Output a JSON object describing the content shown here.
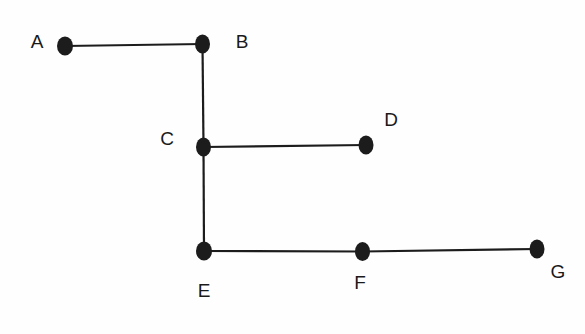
{
  "figure": {
    "type": "node-link-diagram",
    "title": "",
    "background_color": "#fefefe",
    "ink_color": "#1c1c1c",
    "label_color": "#1a1a1a"
  },
  "nodes": [
    {
      "id": "A",
      "label": "A",
      "cx": 65,
      "cy": 46,
      "rx": 8,
      "ry": 9.5,
      "label_x": 37,
      "label_y": 43
    },
    {
      "id": "B",
      "label": "B",
      "cx": 202.5,
      "cy": 44,
      "rx": 7.5,
      "ry": 9.5,
      "label_x": 242,
      "label_y": 43
    },
    {
      "id": "C",
      "label": "C",
      "cx": 203.5,
      "cy": 147,
      "rx": 7.5,
      "ry": 9.5,
      "label_x": 167,
      "label_y": 140
    },
    {
      "id": "D",
      "label": "D",
      "cx": 366,
      "cy": 145,
      "rx": 7.5,
      "ry": 9.5,
      "label_x": 391,
      "label_y": 121
    },
    {
      "id": "E",
      "label": "E",
      "cx": 204,
      "cy": 251,
      "rx": 8,
      "ry": 9.5,
      "label_x": 204,
      "label_y": 292
    },
    {
      "id": "F",
      "label": "F",
      "cx": 362.5,
      "cy": 251.5,
      "rx": 7.5,
      "ry": 9.5,
      "label_x": 360,
      "label_y": 284
    },
    {
      "id": "G",
      "label": "G",
      "cx": 537,
      "cy": 249,
      "rx": 7.5,
      "ry": 9.5,
      "label_x": 558,
      "label_y": 273
    }
  ],
  "edges": [
    {
      "id": "edge-a-b",
      "from": "A",
      "to": "B",
      "x1": 65,
      "y1": 46,
      "x2": 202.5,
      "y2": 44
    },
    {
      "id": "edge-b-c",
      "from": "B",
      "to": "C",
      "x1": 202.5,
      "y1": 44,
      "x2": 203.5,
      "y2": 147
    },
    {
      "id": "edge-c-d",
      "from": "C",
      "to": "D",
      "x1": 203.5,
      "y1": 147,
      "x2": 366,
      "y2": 145
    },
    {
      "id": "edge-c-e",
      "from": "C",
      "to": "E",
      "x1": 203.5,
      "y1": 147,
      "x2": 204,
      "y2": 251
    },
    {
      "id": "edge-e-f",
      "from": "E",
      "to": "F",
      "x1": 204,
      "y1": 251,
      "x2": 362.5,
      "y2": 251.5
    },
    {
      "id": "edge-f-g",
      "from": "F",
      "to": "G",
      "x1": 362.5,
      "y1": 251.5,
      "x2": 537,
      "y2": 249
    }
  ]
}
